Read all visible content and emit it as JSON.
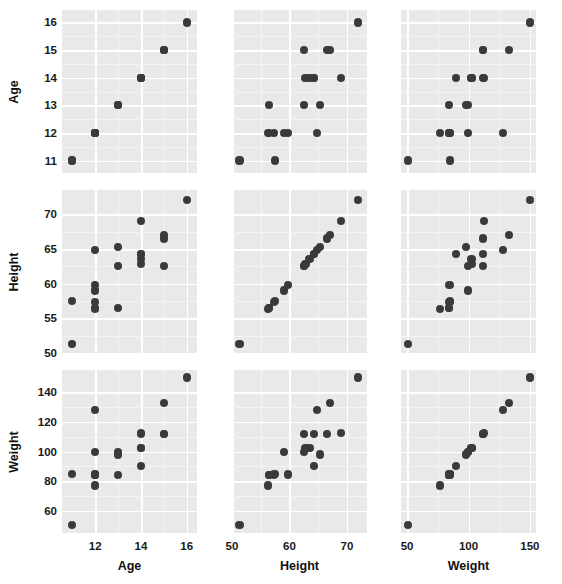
{
  "figure": {
    "type": "scatterplot-matrix",
    "variables": [
      "Age",
      "Height",
      "Weight"
    ],
    "background": "#ffffff",
    "panel_fill": "#e9e9e9",
    "grid_color": "#ffffff",
    "point_color": "#3a3a3a"
  },
  "axis_titles": {
    "age": "Age",
    "height": "Height",
    "weight": "Weight"
  },
  "ticks": {
    "age": {
      "y": [
        "11",
        "12",
        "13",
        "14",
        "15",
        "16"
      ],
      "y_values": [
        11,
        12,
        13,
        14,
        15,
        16
      ],
      "x": [
        "12",
        "14",
        "16"
      ],
      "x_values": [
        12,
        14,
        16
      ],
      "range": [
        10.55,
        16.45
      ]
    },
    "height": {
      "y": [
        "50",
        "55",
        "60",
        "65",
        "70"
      ],
      "y_values": [
        50,
        55,
        60,
        65,
        70
      ],
      "x": [
        "50",
        "60",
        "70"
      ],
      "x_values": [
        50,
        60,
        70
      ],
      "range": [
        50.0,
        73.5
      ]
    },
    "weight": {
      "y": [
        "60",
        "80",
        "100",
        "120",
        "140"
      ],
      "y_values": [
        60,
        80,
        100,
        120,
        140
      ],
      "x": [
        "50",
        "100",
        "150"
      ],
      "x_values": [
        50,
        100,
        150
      ],
      "range": [
        45,
        155
      ]
    }
  },
  "chart_data": {
    "type": "scatter",
    "title": "",
    "subtitle": "",
    "xlabel": "",
    "ylabel": "",
    "grid": true,
    "legend": "none",
    "variables": [
      "Age",
      "Height",
      "Weight"
    ],
    "axis_ranges": {
      "Age": [
        10.55,
        16.45
      ],
      "Height": [
        50.0,
        73.5
      ],
      "Weight": [
        45,
        155
      ]
    },
    "observations": [
      {
        "Age": 11,
        "Height": 51.3,
        "Weight": 50.5
      },
      {
        "Age": 11,
        "Height": 57.5,
        "Weight": 85.0
      },
      {
        "Age": 12,
        "Height": 56.3,
        "Weight": 77.0
      },
      {
        "Age": 12,
        "Height": 56.5,
        "Weight": 84.0
      },
      {
        "Age": 12,
        "Height": 57.3,
        "Weight": 84.5
      },
      {
        "Age": 12,
        "Height": 59.0,
        "Weight": 99.5
      },
      {
        "Age": 12,
        "Height": 59.8,
        "Weight": 84.5
      },
      {
        "Age": 12,
        "Height": 64.8,
        "Weight": 128.0
      },
      {
        "Age": 13,
        "Height": 56.5,
        "Weight": 84.0
      },
      {
        "Age": 13,
        "Height": 62.5,
        "Weight": 99.5
      },
      {
        "Age": 13,
        "Height": 65.3,
        "Weight": 98.0
      },
      {
        "Age": 14,
        "Height": 62.8,
        "Weight": 102.5
      },
      {
        "Age": 14,
        "Height": 63.5,
        "Weight": 102.5
      },
      {
        "Age": 14,
        "Height": 64.3,
        "Weight": 112.0
      },
      {
        "Age": 14,
        "Height": 64.3,
        "Weight": 90.0
      },
      {
        "Age": 14,
        "Height": 69.0,
        "Weight": 112.5
      },
      {
        "Age": 15,
        "Height": 62.5,
        "Weight": 112.0
      },
      {
        "Age": 15,
        "Height": 66.5,
        "Weight": 112.0
      },
      {
        "Age": 15,
        "Height": 67.0,
        "Weight": 133.0
      },
      {
        "Age": 16,
        "Height": 72.0,
        "Weight": 150.0
      }
    ],
    "panels": [
      {
        "row": 0,
        "col": 0,
        "x": "Age",
        "y": "Age"
      },
      {
        "row": 0,
        "col": 1,
        "x": "Height",
        "y": "Age"
      },
      {
        "row": 0,
        "col": 2,
        "x": "Weight",
        "y": "Age"
      },
      {
        "row": 1,
        "col": 0,
        "x": "Age",
        "y": "Height"
      },
      {
        "row": 1,
        "col": 1,
        "x": "Height",
        "y": "Height"
      },
      {
        "row": 1,
        "col": 2,
        "x": "Weight",
        "y": "Height"
      },
      {
        "row": 2,
        "col": 0,
        "x": "Age",
        "y": "Weight"
      },
      {
        "row": 2,
        "col": 1,
        "x": "Height",
        "y": "Weight"
      },
      {
        "row": 2,
        "col": 2,
        "x": "Weight",
        "y": "Weight"
      }
    ]
  },
  "layout": {
    "panel_cols": [
      {
        "left": 62,
        "width": 135
      },
      {
        "left": 232,
        "width": 135
      },
      {
        "left": 401,
        "width": 135
      }
    ],
    "panel_rows": [
      {
        "top": 10,
        "height": 163
      },
      {
        "top": 190,
        "height": 163
      },
      {
        "top": 370,
        "height": 163
      }
    ]
  }
}
